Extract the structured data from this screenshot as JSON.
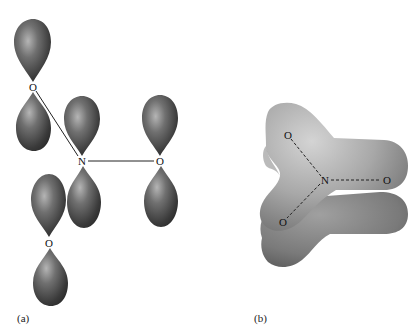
{
  "figure": {
    "panel_a": {
      "caption": "(a)",
      "atoms": [
        {
          "symbol": "O",
          "x": 33,
          "y": 87
        },
        {
          "symbol": "N",
          "x": 82,
          "y": 161
        },
        {
          "symbol": "O",
          "x": 160,
          "y": 161
        },
        {
          "symbol": "O",
          "x": 49,
          "y": 243
        }
      ]
    },
    "panel_b": {
      "caption": "(b)",
      "atoms": [
        {
          "symbol": "O",
          "x": 288,
          "y": 135
        },
        {
          "symbol": "N",
          "x": 325,
          "y": 180
        },
        {
          "symbol": "O",
          "x": 387,
          "y": 180
        },
        {
          "symbol": "O",
          "x": 283,
          "y": 222
        }
      ]
    },
    "colors": {
      "lobe_dark": "#2e2e2e",
      "lobe_light": "#9a9a9a",
      "blob_light": "#c8c8c8",
      "blob_dark": "#6e6e6e",
      "background": "#ffffff"
    }
  }
}
